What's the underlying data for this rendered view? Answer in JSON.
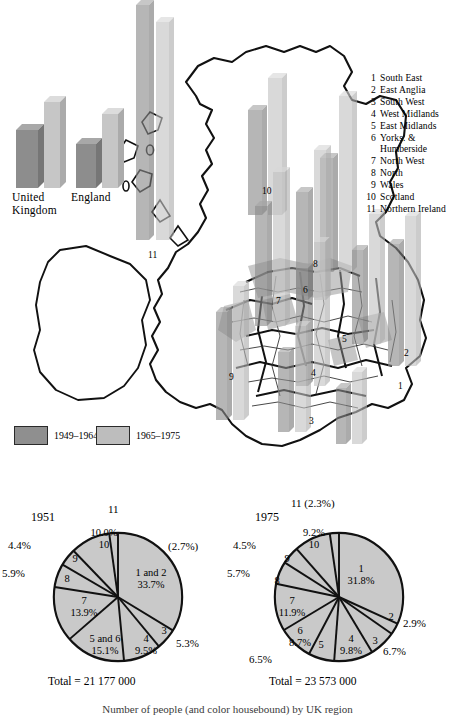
{
  "figure": {
    "caption": "Number of people (and color housebound) by UK region"
  },
  "map": {
    "inset_chart": {
      "type": "bar",
      "categories": [
        "United Kingdom",
        "England"
      ],
      "series": [
        {
          "name": "1949-1964",
          "values": [
            62,
            46
          ]
        },
        {
          "name": "1965-1975",
          "values": [
            84,
            70
          ]
        }
      ],
      "labels": [
        "United",
        "Kingdom",
        "England"
      ],
      "label_united": "United",
      "label_kingdom": "Kingdom",
      "label_england": "England"
    },
    "legend": {
      "items": [
        {
          "label": "1949–1964",
          "color": "#8f8f8f"
        },
        {
          "label": "1965–1975",
          "color": "#bdbdbd"
        }
      ]
    },
    "region_key": {
      "items": [
        {
          "num": "1",
          "name": "South East"
        },
        {
          "num": "2",
          "name": "East Anglia"
        },
        {
          "num": "3",
          "name": "South West"
        },
        {
          "num": "4",
          "name": "West Midlands"
        },
        {
          "num": "5",
          "name": "East Midlands"
        },
        {
          "num": "6",
          "name": "Yorks. &"
        },
        {
          "num": "7",
          "name": "North West"
        },
        {
          "num": "8",
          "name": "North"
        },
        {
          "num": "9",
          "name": "Wales"
        },
        {
          "num": "10",
          "name": "Scotland"
        },
        {
          "num": "11",
          "name": "Northern Ireland"
        }
      ],
      "continuation": "Humberside"
    },
    "region_numbers": [
      {
        "id": "1",
        "x": 398,
        "y": 381
      },
      {
        "id": "2",
        "x": 404,
        "y": 348
      },
      {
        "id": "3",
        "x": 309,
        "y": 416
      },
      {
        "id": "4",
        "x": 311,
        "y": 368
      },
      {
        "id": "5",
        "x": 342,
        "y": 334
      },
      {
        "id": "6",
        "x": 303,
        "y": 285
      },
      {
        "id": "7",
        "x": 276,
        "y": 296
      },
      {
        "id": "8",
        "x": 313,
        "y": 259
      },
      {
        "id": "9",
        "x": 229,
        "y": 372
      },
      {
        "id": "10",
        "x": 262,
        "y": 186
      },
      {
        "id": "11",
        "x": 148,
        "y": 250
      }
    ],
    "bars": [
      {
        "region": "11",
        "x": 136,
        "w": 13,
        "h1": 235,
        "h2": 218
      },
      {
        "region": "10",
        "x": 260,
        "w": 15,
        "h1": 180,
        "h2": 235
      },
      {
        "region": "8",
        "x": 320,
        "w": 14,
        "h1": 118,
        "h2": 190
      },
      {
        "region": "2",
        "x": 392,
        "w": 12,
        "h1": 64,
        "h2": 118
      },
      {
        "region": "6",
        "x": 296,
        "w": 13,
        "h1": 108,
        "h2": 152
      },
      {
        "region": "7",
        "x": 268,
        "w": 13,
        "h1": 95,
        "h2": 128
      },
      {
        "region": "5",
        "x": 352,
        "w": 12,
        "h1": 76,
        "h2": 118
      },
      {
        "region": "4",
        "x": 300,
        "w": 13,
        "h1": 66,
        "h2": 92
      },
      {
        "region": "9",
        "x": 222,
        "w": 12,
        "h1": 60,
        "h2": 86
      },
      {
        "region": "3",
        "x": 280,
        "w": 12,
        "h1": 56,
        "h2": 76
      },
      {
        "region": "1",
        "x": 368,
        "w": 12,
        "h1": 84,
        "h2": 120
      }
    ]
  },
  "chart_data": [
    {
      "type": "pie",
      "title": "1951",
      "total_label": "Total  =  21 177 000",
      "total_value": 21177000,
      "labels": [
        "1 and 2",
        "3",
        "4",
        "5 and 6",
        "7",
        "8",
        "9",
        "10",
        "11"
      ],
      "values": [
        33.7,
        5.3,
        9.5,
        15.1,
        13.9,
        5.9,
        4.4,
        10.0,
        2.7
      ],
      "value_labels": [
        "33.7%",
        "5.3%",
        "9.5%",
        "15.1%",
        "13.9%",
        "5.9%",
        "4.4%",
        "10.0%",
        "(2.7%)"
      ],
      "slice_text": {
        "s1and2_name": "1 and 2",
        "s1and2_pct": "33.7%",
        "s3_name": "3",
        "s3_pct": "5.3%",
        "s4_name": "4",
        "s4_pct": "9.5%",
        "s56_name": "5 and 6",
        "s56_pct": "15.1%",
        "s7_name": "7",
        "s7_pct": "13.9%",
        "s8_name": "8",
        "s8_pct": "5.9%",
        "s9_name": "9",
        "s9_pct": "4.4%",
        "s10_name": "10",
        "s10_pct": "10.0%",
        "s11_name": "11",
        "s11_pct": "(2.7%)"
      }
    },
    {
      "type": "pie",
      "title": "1975",
      "total_label": "Total  =  23 573 000",
      "total_value": 23573000,
      "labels": [
        "1",
        "2",
        "3",
        "4",
        "5",
        "6",
        "7",
        "8",
        "9",
        "10",
        "11"
      ],
      "values": [
        31.8,
        2.9,
        6.7,
        9.8,
        6.5,
        8.7,
        11.9,
        5.7,
        4.5,
        9.2,
        2.3
      ],
      "value_labels": [
        "31.8%",
        "2.9%",
        "6.7%",
        "9.8%",
        "6.5%",
        "8.7%",
        "11.9%",
        "5.7%",
        "4.5%",
        "9.2%",
        "(2.3%)"
      ],
      "slice_text": {
        "s1_name": "1",
        "s1_pct": "31.8%",
        "s2_name": "2",
        "s2_pct": "2.9%",
        "s3_name": "3",
        "s3_pct": "6.7%",
        "s4_name": "4",
        "s4_pct": "9.8%",
        "s5_name": "5",
        "s5_pct": "6.5%",
        "s6_name": "6",
        "s6_pct": "8.7%",
        "s7_name": "7",
        "s7_pct": "11.9%",
        "s8_name": "8",
        "s8_pct": "5.7%",
        "s9_name": "9",
        "s9_pct": "4.5%",
        "s10_name": "10",
        "s10_pct": "9.2%",
        "s11_label": "11 (2.3%)"
      }
    }
  ]
}
